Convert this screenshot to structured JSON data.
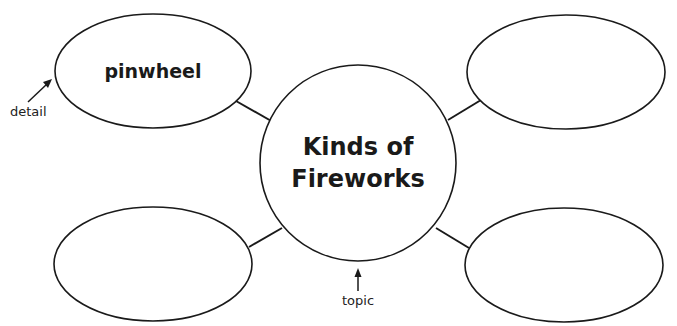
{
  "diagram": {
    "type": "web organizer",
    "topic": {
      "line1": "Kinds of",
      "line2": "Fireworks"
    },
    "details": [
      {
        "position": "top-left",
        "text": "pinwheel"
      },
      {
        "position": "top-right",
        "text": ""
      },
      {
        "position": "bottom-left",
        "text": ""
      },
      {
        "position": "bottom-right",
        "text": ""
      }
    ],
    "annotations": {
      "detail_label": "detail",
      "topic_label": "topic"
    },
    "colors": {
      "stroke": "#1a1a1a",
      "background": "#ffffff"
    }
  }
}
